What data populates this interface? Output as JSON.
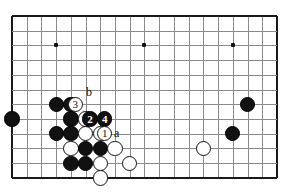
{
  "board": {
    "type": "go-board-diagram",
    "origin_x": 12,
    "origin_y": 16,
    "spacing": 14.72,
    "cols": 19,
    "rows": 12,
    "line_color": "#8a8a8a",
    "edge_color": "#1a1a1a",
    "background": "#ffffff",
    "star_points": [
      {
        "col": 3,
        "row": 2
      },
      {
        "col": 9,
        "row": 2
      },
      {
        "col": 15,
        "row": 2
      }
    ]
  },
  "stones": [
    {
      "col": 3,
      "row": 6,
      "color": "black",
      "label": ""
    },
    {
      "col": 4,
      "row": 6,
      "color": "black",
      "label": ""
    },
    {
      "col": 0,
      "row": 7,
      "color": "black",
      "label": ""
    },
    {
      "col": 4,
      "row": 7,
      "color": "black",
      "label": ""
    },
    {
      "col": 5,
      "row": 7,
      "color": "white",
      "label": ""
    },
    {
      "col": 3,
      "row": 8,
      "color": "black",
      "label": ""
    },
    {
      "col": 4,
      "row": 8,
      "color": "black",
      "label": ""
    },
    {
      "col": 5,
      "row": 8,
      "color": "white",
      "label": ""
    },
    {
      "col": 6,
      "row": 8,
      "color": "white",
      "label": ""
    },
    {
      "col": 4,
      "row": 9,
      "color": "white",
      "label": ""
    },
    {
      "col": 5,
      "row": 9,
      "color": "black",
      "label": ""
    },
    {
      "col": 6,
      "row": 9,
      "color": "black",
      "label": ""
    },
    {
      "col": 7,
      "row": 9,
      "color": "white",
      "label": ""
    },
    {
      "col": 4,
      "row": 10,
      "color": "black",
      "label": ""
    },
    {
      "col": 5,
      "row": 10,
      "color": "black",
      "label": ""
    },
    {
      "col": 6,
      "row": 10,
      "color": "white",
      "label": ""
    },
    {
      "col": 8,
      "row": 10,
      "color": "white",
      "label": ""
    },
    {
      "col": 6,
      "row": 11,
      "color": "white",
      "label": ""
    },
    {
      "col": 16,
      "row": 6,
      "color": "black",
      "label": ""
    },
    {
      "col": 15,
      "row": 8,
      "color": "black",
      "label": ""
    },
    {
      "col": 13,
      "row": 9,
      "color": "white",
      "label": ""
    },
    {
      "col": 4.3,
      "row": 6,
      "color": "white",
      "label": "3"
    },
    {
      "col": 5.3,
      "row": 7,
      "color": "black",
      "label": "2"
    },
    {
      "col": 6.3,
      "row": 7,
      "color": "black",
      "label": "4"
    },
    {
      "col": 6.3,
      "row": 8,
      "color": "white",
      "label": "1"
    }
  ],
  "markers": [
    {
      "text": "b",
      "col": 5.3,
      "row": 5.2,
      "name": "point-marker-b"
    },
    {
      "text": "a",
      "col": 7.2,
      "row": 8.0,
      "name": "point-marker-a"
    }
  ]
}
